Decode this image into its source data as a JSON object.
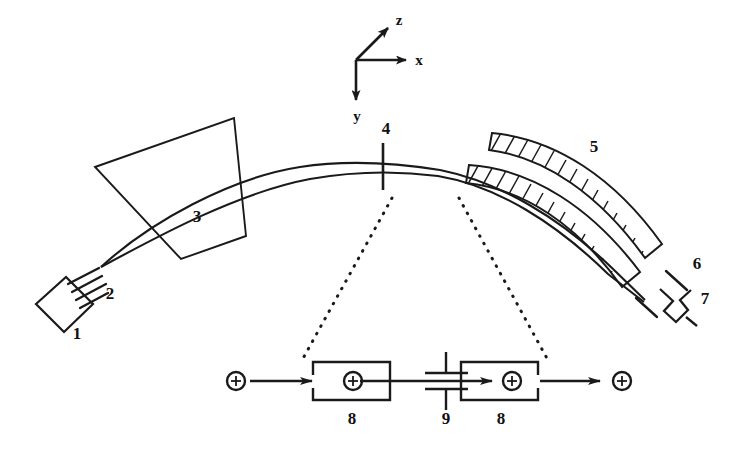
{
  "figure": {
    "background_color": "#ffffff",
    "stroke_color": "#1a1a1a"
  },
  "axes": {
    "origin_label": "",
    "x_label": "x",
    "y_label": "y",
    "z_label": "z"
  },
  "callouts": [
    {
      "id": "1",
      "label": "1",
      "name": "ion-source"
    },
    {
      "id": "2",
      "label": "2",
      "name": "extraction-grid"
    },
    {
      "id": "3",
      "label": "3",
      "name": "einzel-lens"
    },
    {
      "id": "4",
      "label": "4",
      "name": "slit-aperture"
    },
    {
      "id": "5",
      "label": "5",
      "name": "magnetic-sector"
    },
    {
      "id": "6",
      "label": "6",
      "name": "exit-slit"
    },
    {
      "id": "7",
      "label": "7",
      "name": "detector"
    },
    {
      "id": "8a",
      "label": "8",
      "name": "inset-electrode-left"
    },
    {
      "id": "9",
      "label": "9",
      "name": "inset-capacitor"
    },
    {
      "id": "8b",
      "label": "8",
      "name": "inset-electrode-right"
    }
  ],
  "inset": {
    "ion_symbol": "+",
    "left_label": "8",
    "center_label": "9",
    "right_label": "8"
  }
}
